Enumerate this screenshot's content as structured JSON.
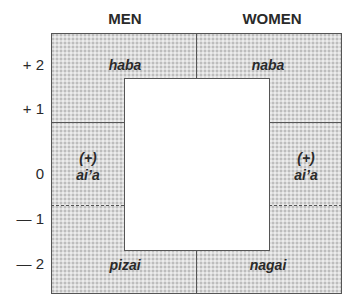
{
  "columns": {
    "men": "MEN",
    "women": "WOMEN"
  },
  "axis": {
    "ticks": [
      "+ 2",
      "+ 1",
      "0",
      "— 1",
      "— 2"
    ]
  },
  "terms": {
    "men_plus2": "haba",
    "women_plus2": "naba",
    "men_0_prefix": "(+)",
    "men_0": "ai’a",
    "women_0_prefix": "(+)",
    "women_0": "ai’a",
    "men_minus2": "pizai",
    "women_minus2": "nagai"
  },
  "colors": {
    "shading": "#dcdcdc",
    "border": "#555555",
    "text": "#2a2a2a"
  }
}
